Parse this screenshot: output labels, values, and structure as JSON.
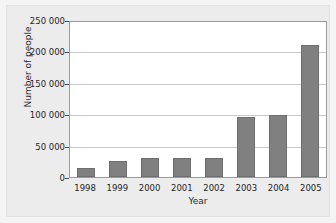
{
  "chart_data": {
    "type": "bar",
    "title": "",
    "xlabel": "Year",
    "ylabel": "Number of people",
    "categories": [
      "1998",
      "1999",
      "2000",
      "2001",
      "2002",
      "2003",
      "2004",
      "2005"
    ],
    "values": [
      14000,
      25000,
      31000,
      31000,
      30000,
      95000,
      98000,
      210000
    ],
    "ylim": [
      0,
      250000
    ],
    "yticks": [
      0,
      50000,
      100000,
      150000,
      200000,
      250000
    ],
    "ytick_labels": [
      "0",
      "50 000",
      "100 000",
      "150 000",
      "200 000",
      "250 000"
    ],
    "grid": true,
    "legend": false,
    "bar_color": "#808080",
    "panel_color": "#ffffff",
    "background_color": "#ececec",
    "gridline_color": "#c9c9c9",
    "axis_color": "#9a9a9a"
  }
}
